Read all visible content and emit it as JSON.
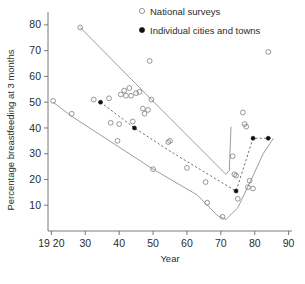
{
  "chart_data": {
    "type": "scatter",
    "title": "",
    "xlabel": "Year",
    "ylabel": "Percentage breastfeeding at 3 months",
    "xlim": [
      1919,
      1991
    ],
    "ylim": [
      0,
      85
    ],
    "grid": false,
    "x_tick_labels": [
      "19 20",
      "30",
      "40",
      "50",
      "60",
      "70",
      "80",
      "90"
    ],
    "x_tick_values": [
      1920,
      1930,
      1940,
      1950,
      1960,
      1970,
      1980,
      1990
    ],
    "y_tick_labels": [
      "10",
      "20",
      "30",
      "40",
      "50",
      "60",
      "70",
      "80"
    ],
    "y_tick_values": [
      10,
      20,
      30,
      40,
      50,
      60,
      70,
      80
    ],
    "legend": {
      "position": "top-right",
      "entries": [
        {
          "label": "National surveys",
          "marker": "open-circle"
        },
        {
          "label": "Individual cities and towns",
          "marker": "filled-circle"
        }
      ]
    },
    "series": [
      {
        "name": "National surveys",
        "marker": "open-circle",
        "points": [
          [
            1920.5,
            50.5
          ],
          [
            1926,
            45.5
          ],
          [
            1928.5,
            79.0
          ],
          [
            1932.5,
            51.0
          ],
          [
            1937,
            51.5
          ],
          [
            1937.5,
            42.0
          ],
          [
            1939.5,
            35.0
          ],
          [
            1940,
            41.5
          ],
          [
            1940.5,
            53.0
          ],
          [
            1941.5,
            54.5
          ],
          [
            1942,
            52.5
          ],
          [
            1943,
            55.5
          ],
          [
            1943.5,
            52.5
          ],
          [
            1444,
            0
          ],
          [
            1944,
            42.5
          ],
          [
            1945,
            53.5
          ],
          [
            1946,
            54.0
          ],
          [
            1947,
            47.5
          ],
          [
            1947.5,
            45.5
          ],
          [
            1948.5,
            47.0
          ],
          [
            1949,
            66.0
          ],
          [
            1949.5,
            51.0
          ],
          [
            1950,
            24.0
          ],
          [
            1954.5,
            34.5
          ],
          [
            1955,
            35.0
          ],
          [
            1960,
            24.5
          ],
          [
            1965.5,
            19.0
          ],
          [
            1966,
            11.0
          ],
          [
            1970.5,
            5.5
          ],
          [
            1973.5,
            29.0
          ],
          [
            1974,
            22.0
          ],
          [
            1974.5,
            21.5
          ],
          [
            1975,
            12.5
          ],
          [
            1976.5,
            46.0
          ],
          [
            1977,
            41.5
          ],
          [
            1977.5,
            40.5
          ],
          [
            1978,
            17.0
          ],
          [
            1978.5,
            19.5
          ],
          [
            1979.5,
            16.5
          ],
          [
            1984,
            69.5
          ]
        ]
      },
      {
        "name": "Individual cities and towns",
        "marker": "filled-circle",
        "points": [
          [
            1934.5,
            50.0
          ],
          [
            1944.5,
            40.0
          ],
          [
            1974.5,
            15.5
          ],
          [
            1979.5,
            36.0
          ],
          [
            1984,
            36.0
          ]
        ]
      }
    ],
    "envelopes": [
      {
        "name": "upper-envelope",
        "style": "solid",
        "points": [
          [
            1928.5,
            79.0
          ],
          [
            1949.5,
            51.0
          ],
          [
            1971.5,
            22.0
          ],
          [
            1972.5,
            23.5
          ],
          [
            1973.0,
            40.5
          ]
        ]
      },
      {
        "name": "lower-envelope",
        "style": "solid",
        "points": [
          [
            1920.5,
            50.0
          ],
          [
            1926.0,
            44.5
          ],
          [
            1950.0,
            24.0
          ],
          [
            1963.0,
            14.0
          ],
          [
            1969.0,
            6.0
          ],
          [
            1971.5,
            4.5
          ],
          [
            1975.0,
            9.0
          ],
          [
            1979.0,
            20.0
          ],
          [
            1982.5,
            30.0
          ],
          [
            1985.5,
            36.0
          ]
        ]
      },
      {
        "name": "middle-trend-dashed",
        "style": "dashed",
        "points": [
          [
            1934.5,
            50.0
          ],
          [
            1944.5,
            40.0
          ],
          [
            1955.0,
            31.0
          ],
          [
            1965.0,
            23.0
          ],
          [
            1974.5,
            15.5
          ],
          [
            1979.5,
            36.0
          ],
          [
            1984.0,
            36.0
          ]
        ]
      }
    ]
  }
}
